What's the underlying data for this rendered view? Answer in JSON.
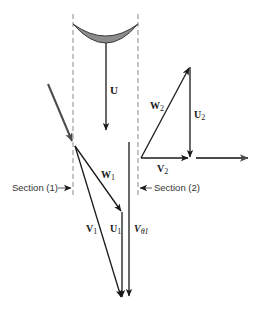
{
  "diagram": {
    "title": "",
    "colors": {
      "vector": "#1a1a1a",
      "inlet_flow": "#4a4a4a",
      "dashed": "#8a8a8a",
      "blade_fill": "#8c8c8c",
      "blade_stroke": "#3a3a3a"
    },
    "labels": {
      "blade_speed": {
        "main": "U",
        "sub": ""
      },
      "W1": {
        "main": "W",
        "sub": "1"
      },
      "V1": {
        "main": "V",
        "sub": "1"
      },
      "U1": {
        "main": "U",
        "sub": "1"
      },
      "Vtheta1": {
        "main": "V",
        "sub": "θ1"
      },
      "W2": {
        "main": "W",
        "sub": "2"
      },
      "U2": {
        "main": "U",
        "sub": "2"
      },
      "V2": {
        "main": "V",
        "sub": "2"
      },
      "section1": "Section (1)",
      "section2": "Section (2)"
    },
    "nodes": [
      {
        "id": "blade",
        "type": "curved-blade"
      },
      {
        "id": "inlet-flow-arrow",
        "type": "arrow"
      },
      {
        "id": "U",
        "type": "vector"
      },
      {
        "id": "W1",
        "type": "vector"
      },
      {
        "id": "V1",
        "type": "vector"
      },
      {
        "id": "U1",
        "type": "vector"
      },
      {
        "id": "Vtheta1",
        "type": "vector"
      },
      {
        "id": "W2",
        "type": "vector"
      },
      {
        "id": "U2",
        "type": "vector"
      },
      {
        "id": "V2",
        "type": "vector"
      },
      {
        "id": "outlet-flow-arrow",
        "type": "arrow"
      }
    ],
    "edges": [
      {
        "from": "W1",
        "to": "U1",
        "relation": "head-to-tail"
      },
      {
        "from": "V2",
        "to": "U2",
        "relation": "head-to-head"
      },
      {
        "from": "W2",
        "to": "U2",
        "relation": "shared-apex"
      }
    ]
  }
}
